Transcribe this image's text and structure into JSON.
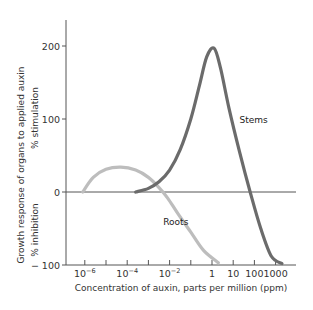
{
  "chart_data": {
    "type": "line",
    "title": "",
    "xlabel": "Concentration of auxin, parts per million (ppm)",
    "ylabel": "Growth response of organs to applied auxin",
    "ylabel_upper": "% stimulation",
    "ylabel_lower": "% inhibition",
    "x_scale": "log10",
    "x_ticks": [
      {
        "exp": -6,
        "label": "10^-6",
        "base": "10",
        "sup": "−6"
      },
      {
        "exp": -5,
        "label": "",
        "base": "",
        "sup": ""
      },
      {
        "exp": -4,
        "label": "10^-4",
        "base": "10",
        "sup": "−4"
      },
      {
        "exp": -3,
        "label": "",
        "base": "",
        "sup": ""
      },
      {
        "exp": -2,
        "label": "10^-2",
        "base": "10",
        "sup": "−2"
      },
      {
        "exp": -1,
        "label": "",
        "base": "",
        "sup": ""
      },
      {
        "exp": 0,
        "label": "1",
        "base": "1",
        "sup": ""
      },
      {
        "exp": 1,
        "label": "10",
        "base": "10",
        "sup": ""
      },
      {
        "exp": 2,
        "label": "100",
        "base": "100",
        "sup": ""
      },
      {
        "exp": 3,
        "label": "1000",
        "base": "1000",
        "sup": ""
      }
    ],
    "y_ticks": [
      {
        "value": 200,
        "label": "200"
      },
      {
        "value": 100,
        "label": "100"
      },
      {
        "value": 0,
        "label": "0"
      },
      {
        "value": -100,
        "label": "− 100"
      }
    ],
    "ylim": [
      -100,
      240
    ],
    "xlim_exp": [
      -7,
      3.7
    ],
    "grid": false,
    "legend": "inline labels",
    "series": [
      {
        "name": "Roots",
        "color": "#bdbdbd",
        "label_pos": {
          "x_exp": -2.3,
          "y": -45
        },
        "points": [
          {
            "x_exp": -6.1,
            "y": 0
          },
          {
            "x_exp": -5.6,
            "y": 20
          },
          {
            "x_exp": -5.0,
            "y": 31
          },
          {
            "x_exp": -4.3,
            "y": 34
          },
          {
            "x_exp": -3.6,
            "y": 30
          },
          {
            "x_exp": -3.0,
            "y": 20
          },
          {
            "x_exp": -2.5,
            "y": 6
          },
          {
            "x_exp": -2.1,
            "y": -8
          },
          {
            "x_exp": -1.6,
            "y": -30
          },
          {
            "x_exp": -1.0,
            "y": -55
          },
          {
            "x_exp": -0.4,
            "y": -80
          },
          {
            "x_exp": 0.3,
            "y": -97
          }
        ]
      },
      {
        "name": "Stems",
        "color": "#6b6b6b",
        "label_pos": {
          "x_exp": 1.3,
          "y": 95
        },
        "points": [
          {
            "x_exp": -3.6,
            "y": 0
          },
          {
            "x_exp": -3.0,
            "y": 5
          },
          {
            "x_exp": -2.5,
            "y": 14
          },
          {
            "x_exp": -2.0,
            "y": 30
          },
          {
            "x_exp": -1.5,
            "y": 58
          },
          {
            "x_exp": -1.0,
            "y": 100
          },
          {
            "x_exp": -0.6,
            "y": 145
          },
          {
            "x_exp": -0.25,
            "y": 185
          },
          {
            "x_exp": 0.1,
            "y": 197
          },
          {
            "x_exp": 0.4,
            "y": 170
          },
          {
            "x_exp": 0.8,
            "y": 115
          },
          {
            "x_exp": 1.3,
            "y": 55
          },
          {
            "x_exp": 1.8,
            "y": 0
          },
          {
            "x_exp": 2.3,
            "y": -50
          },
          {
            "x_exp": 2.8,
            "y": -88
          },
          {
            "x_exp": 3.3,
            "y": -98
          }
        ]
      }
    ]
  }
}
